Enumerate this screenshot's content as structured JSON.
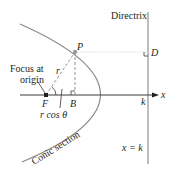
{
  "diagram": {
    "labels": {
      "directrix": "Directrix",
      "point_p": "P",
      "point_d": "D",
      "focus_line1": "Focus at",
      "focus_line2": "origin",
      "segment_r": "r",
      "focus_f": "F",
      "point_b": "B",
      "x_axis": "x",
      "k_tick": "k",
      "r_cos_theta": "r cos θ",
      "theta": "θ",
      "conic_section": "Conic section",
      "directrix_eq": "x = k"
    },
    "colors": {
      "curve": "#8a8a8a",
      "axis": "#3a3a3a",
      "directrix_line": "#9a9a9a",
      "dashed": "#8a8a8a",
      "point_fill": "#9a9a9a",
      "focus_fill": "#231f20",
      "text": "#231f20"
    }
  }
}
